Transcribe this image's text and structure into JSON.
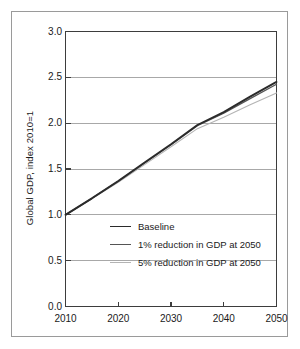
{
  "chart_data": {
    "type": "line",
    "title": "",
    "xlabel": "",
    "ylabel": "Global GDP, index 2010=1",
    "xlim": [
      2010,
      2050
    ],
    "ylim": [
      0.0,
      3.0
    ],
    "grid": true,
    "legend_position": "center",
    "x_ticklabels": [
      "2010",
      "2020",
      "2030",
      "2040",
      "2050"
    ],
    "x_tickvalues": [
      2010,
      2020,
      2030,
      2040,
      2050
    ],
    "y_ticklabels": [
      "0.0",
      "0.5",
      "1.0",
      "1.5",
      "2.0",
      "2.5",
      "3.0"
    ],
    "y_tickvalues": [
      0.0,
      0.5,
      1.0,
      1.5,
      2.0,
      2.5,
      3.0
    ],
    "x": [
      2010,
      2015,
      2020,
      2025,
      2030,
      2035,
      2040,
      2045,
      2050
    ],
    "series": [
      {
        "name": "Baseline",
        "color": "#2b2b2b",
        "width": 1.9,
        "values": [
          1.0,
          1.18,
          1.37,
          1.57,
          1.77,
          1.98,
          2.12,
          2.29,
          2.45
        ]
      },
      {
        "name": "1% reduction in GDP at 2050",
        "color": "#555555",
        "width": 1.3,
        "values": [
          1.0,
          1.18,
          1.365,
          1.565,
          1.765,
          1.972,
          2.108,
          2.268,
          2.425
        ]
      },
      {
        "name": "5% reduction in GDP at 2050",
        "color": "#b4b4b4",
        "width": 1.1,
        "values": [
          1.0,
          1.175,
          1.355,
          1.548,
          1.742,
          1.94,
          2.065,
          2.2,
          2.33
        ]
      }
    ]
  },
  "axes": {
    "border_color": "#3d3d3d",
    "grid_color": "#a8a8a8",
    "tick_color": "#3d3d3d"
  },
  "frame": {
    "border_color": "#9a9a9a"
  }
}
